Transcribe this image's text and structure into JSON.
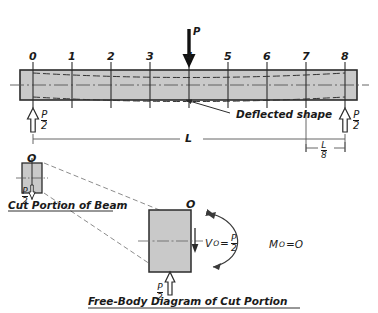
{
  "figure": {
    "type": "engineering-beam-diagram",
    "colors": {
      "beam_fill": "#c9c9c9",
      "beam_stroke": "#2b2b2b",
      "line": "#444444",
      "text": "#1a1a1a",
      "arrow_solid": "#111111"
    }
  },
  "beam": {
    "stations": [
      "0",
      "1",
      "2",
      "3",
      "4",
      "5",
      "6",
      "7",
      "8"
    ],
    "span_label": "L",
    "segment_label": {
      "numerator": "L",
      "denominator": "8"
    },
    "deflected_shape_label": "Deflected shape"
  },
  "loads": {
    "applied_load_label": "P",
    "applied_load_station": "4",
    "left_reaction": {
      "numerator": "P",
      "denominator": "2"
    },
    "right_reaction": {
      "numerator": "P",
      "denominator": "2"
    }
  },
  "cut_portion": {
    "title": "Cut Portion of Beam",
    "node_label": "O",
    "reaction": {
      "numerator": "P",
      "denominator": "2"
    }
  },
  "free_body": {
    "title": "Free-Body Diagram of Cut Portion",
    "node_label": "O",
    "shear_symbol": "V",
    "shear_subscript": "O",
    "shear_equals": "=",
    "shear_value": {
      "numerator": "P",
      "denominator": "2"
    },
    "moment_symbol": "M",
    "moment_subscript": "O",
    "moment_equation": "=O",
    "reaction": {
      "numerator": "P",
      "denominator": "2"
    }
  }
}
